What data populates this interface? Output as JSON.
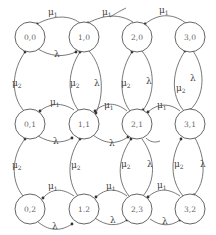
{
  "diagram": {
    "title": "",
    "nodes": [
      {
        "id": "0,0",
        "label": "0,0",
        "x": 30,
        "y": 37
      },
      {
        "id": "1,0",
        "label": "1,0",
        "x": 84,
        "y": 37
      },
      {
        "id": "2,0",
        "label": "2,0",
        "x": 137,
        "y": 37
      },
      {
        "id": "3,0",
        "label": "3,0",
        "x": 190,
        "y": 37
      },
      {
        "id": "0,1",
        "label": "0,1",
        "x": 30,
        "y": 124
      },
      {
        "id": "1,1",
        "label": "1,1",
        "x": 84,
        "y": 124
      },
      {
        "id": "2,1",
        "label": "2,1",
        "x": 137,
        "y": 124
      },
      {
        "id": "3,1",
        "label": "3,1",
        "x": 190,
        "y": 124
      },
      {
        "id": "0,2",
        "label": "0,2",
        "x": 30,
        "y": 209
      },
      {
        "id": "1,2",
        "label": "1.2",
        "x": 84,
        "y": 209
      },
      {
        "id": "2,3",
        "label": "2,3",
        "x": 137,
        "y": 209
      },
      {
        "id": "3,2",
        "label": "3,2",
        "x": 190,
        "y": 209
      }
    ],
    "rate_labels": {
      "mu1": {
        "base": "μ",
        "sub": "1"
      },
      "mu2": {
        "base": "μ",
        "sub": "2"
      },
      "lambda": {
        "base": "λ",
        "sub": ""
      }
    },
    "edges": [
      {
        "from": "1,0",
        "to": "0,0",
        "rate": "mu1"
      },
      {
        "from": "0,0",
        "to": "1,0",
        "rate": "lambda"
      },
      {
        "from": "2,0",
        "to": "1,0",
        "rate": "mu1"
      },
      {
        "from": "3,0",
        "to": "2,0",
        "rate": "mu1"
      },
      {
        "from": "0,1",
        "to": "0,0",
        "rate": "mu2"
      },
      {
        "from": "1,1",
        "to": "1,0",
        "rate": "mu2"
      },
      {
        "from": "1,0",
        "to": "1,1",
        "rate": "lambda"
      },
      {
        "from": "2,1",
        "to": "2,0",
        "rate": "mu2"
      },
      {
        "from": "2,0",
        "to": "2,1",
        "rate": "lambda"
      },
      {
        "from": "3,1",
        "to": "3,0",
        "rate": "mu2"
      },
      {
        "from": "3,0",
        "to": "3,1",
        "rate": "lambda"
      },
      {
        "from": "1,1",
        "to": "0,1",
        "rate": "mu1"
      },
      {
        "from": "0,1",
        "to": "1,1",
        "rate": "lambda"
      },
      {
        "from": "2,1",
        "to": "1,1",
        "rate": "mu1"
      },
      {
        "from": "1,1",
        "to": "2,1",
        "rate": "lambda"
      },
      {
        "from": "3,1",
        "to": "2,1",
        "rate": "mu1"
      },
      {
        "from": "0,2",
        "to": "0,1",
        "rate": "mu2"
      },
      {
        "from": "1,2",
        "to": "1,1",
        "rate": "mu2"
      },
      {
        "from": "2,3",
        "to": "2,1",
        "rate": "mu2"
      },
      {
        "from": "2,1",
        "to": "2,3",
        "rate": "lambda"
      },
      {
        "from": "3,2",
        "to": "3,1",
        "rate": "mu2"
      },
      {
        "from": "3,1",
        "to": "3,2",
        "rate": "lambda"
      },
      {
        "from": "1,2",
        "to": "0,2",
        "rate": "mu1"
      },
      {
        "from": "0,2",
        "to": "1,2",
        "rate": "lambda"
      },
      {
        "from": "2,3",
        "to": "1,2",
        "rate": "mu1"
      },
      {
        "from": "1,2",
        "to": "2,3",
        "rate": "lambda"
      },
      {
        "from": "3,2",
        "to": "2,3",
        "rate": "mu1"
      },
      {
        "from": "2,3",
        "to": "3,2",
        "rate": "lambda"
      }
    ]
  }
}
